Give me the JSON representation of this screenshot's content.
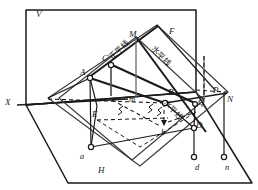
{
  "figure": {
    "title": "",
    "planes": {
      "v_label": "V",
      "h_label": "H",
      "axis_label": "X"
    },
    "chinese_labels": [
      {
        "text": "正平线",
        "meaning": "frontal-line",
        "x": 108,
        "y": 56,
        "rotate": -45
      },
      {
        "text": "水平线",
        "meaning": "horizontal-line",
        "x": 155,
        "y": 45,
        "rotate": 45
      },
      {
        "text": "水平线",
        "meaning": "horizontal-line",
        "x": 167,
        "y": 99,
        "rotate": 45
      }
    ],
    "points": [
      {
        "id": "V",
        "label": "V",
        "x": 36,
        "y": 10,
        "case": "cap"
      },
      {
        "id": "H",
        "label": "H",
        "x": 98,
        "y": 166,
        "case": "cap"
      },
      {
        "id": "X",
        "label": "X",
        "x": 5,
        "y": 98,
        "case": "cap"
      },
      {
        "id": "A",
        "label": "A",
        "x": 80,
        "y": 68,
        "case": "cap"
      },
      {
        "id": "C",
        "label": "C",
        "x": 102,
        "y": 54,
        "case": "cap"
      },
      {
        "id": "E",
        "label": "E",
        "x": 92,
        "y": 110,
        "case": "cap"
      },
      {
        "id": "M",
        "label": "M",
        "x": 129,
        "y": 30,
        "case": "cap"
      },
      {
        "id": "F",
        "label": "F",
        "x": 169,
        "y": 27,
        "case": "cap"
      },
      {
        "id": "B",
        "label": "B",
        "x": 168,
        "y": 88,
        "case": "cap"
      },
      {
        "id": "P",
        "label": "P",
        "x": 213,
        "y": 86,
        "case": "cap"
      },
      {
        "id": "N",
        "label": "N",
        "x": 227,
        "y": 95,
        "case": "cap"
      },
      {
        "id": "Q",
        "label": "Q",
        "x": 198,
        "y": 98,
        "case": "cap"
      },
      {
        "id": "D",
        "label": "D",
        "x": 196,
        "y": 121,
        "case": "cap"
      },
      {
        "id": "c",
        "label": "c",
        "x": 113,
        "y": 95,
        "case": "low"
      },
      {
        "id": "m",
        "label": "m",
        "x": 129,
        "y": 95,
        "case": "low"
      },
      {
        "id": "b",
        "label": "b",
        "x": 161,
        "y": 128,
        "case": "low"
      },
      {
        "id": "a",
        "label": "a",
        "x": 80,
        "y": 152,
        "case": "low"
      },
      {
        "id": "d",
        "label": "d",
        "x": 195,
        "y": 163,
        "case": "low"
      },
      {
        "id": "n",
        "label": "n",
        "x": 225,
        "y": 163,
        "case": "low"
      }
    ],
    "markers": [
      {
        "name": "vertex-A",
        "x": 90,
        "y": 78
      },
      {
        "name": "vertex-C",
        "x": 111,
        "y": 65
      },
      {
        "name": "vertex-B",
        "x": 164,
        "y": 103
      },
      {
        "name": "vertex-D",
        "x": 194,
        "y": 128
      },
      {
        "name": "vertex-a",
        "x": 91,
        "y": 147
      },
      {
        "name": "vertex-d",
        "x": 194,
        "y": 157
      },
      {
        "name": "vertex-n",
        "x": 224,
        "y": 157
      },
      {
        "name": "vertex-Q",
        "x": 195,
        "y": 104
      }
    ],
    "colors": {
      "stroke": "#1a1a1a",
      "plane_stroke": "#2b2b2b",
      "thin_stroke": "#555555",
      "background": "#ffffff"
    }
  }
}
